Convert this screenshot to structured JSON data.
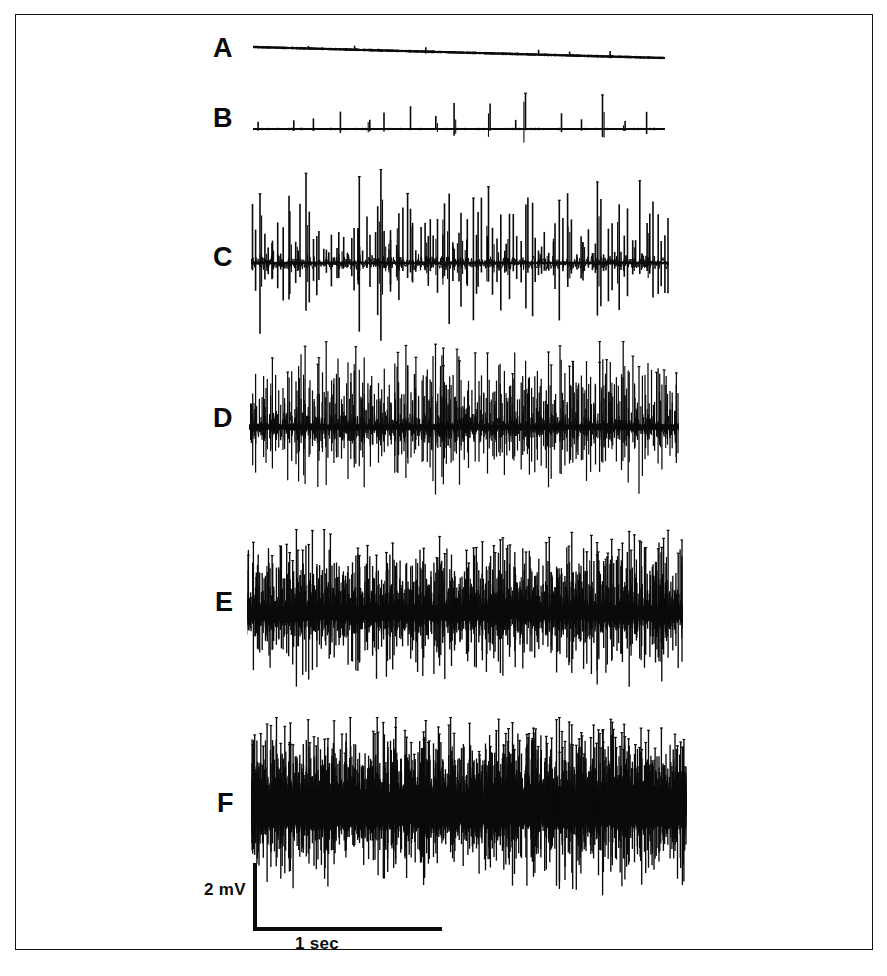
{
  "figure": {
    "kind": "electromyography-recording-panel",
    "border_color": "#111111",
    "background_color": "#ffffff",
    "ink_color": "#0b0b0b"
  },
  "scale_bar": {
    "vertical_label": "2 mV",
    "horizontal_label": "1 sec",
    "vertical_value": 2,
    "vertical_unit": "mV",
    "horizontal_value": 1,
    "horizontal_unit": "sec"
  },
  "traces": [
    {
      "label": "A",
      "description": "near-silent baseline with a few minute spikes, slight downward drift",
      "x": 252,
      "y": 30,
      "width": 412,
      "height": 44,
      "baseline_offset": 16,
      "spike_count": 11,
      "amp_up": 5,
      "amp_down": 2,
      "noise": 0.6,
      "drift": 11,
      "baseline_weight": 2.4,
      "jitter": 0.25,
      "seed": 11
    },
    {
      "label": "B",
      "description": "regular large motor unit potentials at low firing rate",
      "x": 252,
      "y": 88,
      "width": 412,
      "height": 62,
      "baseline_offset": 40,
      "spike_count": 17,
      "amp_up": 36,
      "amp_down": 10,
      "noise": 1.0,
      "drift": 0,
      "baseline_weight": 1.9,
      "jitter": 0.35,
      "seed": 23
    },
    {
      "label": "C",
      "description": "several motor units recruited, biphasic spikes above and below baseline",
      "x": 250,
      "y": 168,
      "width": 418,
      "height": 180,
      "baseline_offset": 94,
      "spike_count": 120,
      "amp_up": 86,
      "amp_down": 74,
      "noise": 9,
      "drift": 0,
      "baseline_weight": 2.6,
      "jitter": 0.55,
      "seed": 37
    },
    {
      "label": "D",
      "description": "increased recruitment, dense spike train with thick baseline",
      "x": 248,
      "y": 340,
      "width": 430,
      "height": 168,
      "baseline_offset": 86,
      "spike_count": 330,
      "amp_up": 80,
      "amp_down": 66,
      "noise": 16,
      "drift": 0,
      "baseline_weight": 6,
      "jitter": 0.7,
      "seed": 53
    },
    {
      "label": "E",
      "description": "high recruitment approaching interference pattern, solid dark core",
      "x": 246,
      "y": 528,
      "width": 436,
      "height": 168,
      "baseline_offset": 84,
      "spike_count": 620,
      "amp_up": 76,
      "amp_down": 70,
      "noise": 24,
      "drift": 0,
      "baseline_weight": 14,
      "jitter": 0.85,
      "seed": 71
    },
    {
      "label": "F",
      "description": "full interference pattern at maximal voluntary contraction",
      "x": 250,
      "y": 716,
      "width": 436,
      "height": 180,
      "baseline_offset": 92,
      "spike_count": 1150,
      "amp_up": 82,
      "amp_down": 78,
      "noise": 34,
      "drift": 0,
      "baseline_weight": 34,
      "jitter": 1.0,
      "seed": 97
    }
  ],
  "labels": {
    "A": {
      "text": "A",
      "x": 212,
      "y": 34
    },
    "B": {
      "text": "B",
      "x": 212,
      "y": 104
    },
    "C": {
      "text": "C",
      "x": 212,
      "y": 243
    },
    "D": {
      "text": "D",
      "x": 212,
      "y": 404
    },
    "E": {
      "text": "E",
      "x": 214,
      "y": 588
    },
    "F": {
      "text": "F",
      "x": 216,
      "y": 789
    }
  },
  "scale_bar_geometry": {
    "origin_x": 252,
    "top_y": 862,
    "bottom_y": 926,
    "right_x": 441,
    "thickness": 4,
    "mv_label_x": 203,
    "mv_label_y": 879,
    "sec_label_x": 294,
    "sec_label_y": 933
  }
}
